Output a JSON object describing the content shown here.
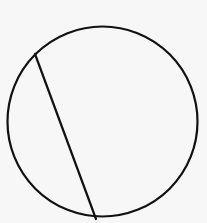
{
  "diagram": {
    "background": "#f7f7f7",
    "stroke_color": "#111111",
    "stroke_width": 2.2,
    "circle": {
      "cx": 102.5,
      "cy": 121.5,
      "r": 95
    },
    "chord": {
      "x1": 35,
      "y1": 54,
      "x2": 96,
      "y2": 219
    }
  }
}
